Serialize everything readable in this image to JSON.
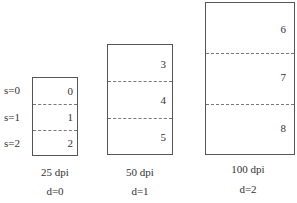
{
  "scale_labels": [
    "s=0",
    "s=1",
    "s=2"
  ],
  "columns": [
    {
      "dpi_label": "25 dpi",
      "depth_label": "d=0",
      "cells": [
        "0",
        "1",
        "2"
      ]
    },
    {
      "dpi_label": "50 dpi",
      "depth_label": "d=1",
      "cells": [
        "3",
        "4",
        "5"
      ]
    },
    {
      "dpi_label": "100 dpi",
      "depth_label": "d=2",
      "cells": [
        "6",
        "7",
        "8"
      ]
    }
  ]
}
